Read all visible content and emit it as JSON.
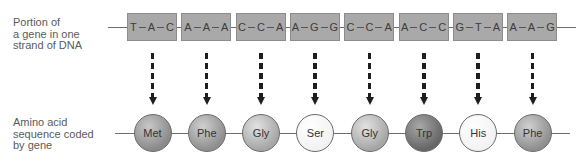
{
  "labels": {
    "dna": [
      "Portion of",
      "a gene in one",
      "strand of DNA"
    ],
    "amino": [
      "Amino acid",
      "sequence coded",
      "by gene"
    ]
  },
  "codons": [
    {
      "bases": [
        "T",
        "A",
        "C"
      ]
    },
    {
      "bases": [
        "A",
        "A",
        "A"
      ]
    },
    {
      "bases": [
        "C",
        "C",
        "A"
      ]
    },
    {
      "bases": [
        "A",
        "G",
        "G"
      ]
    },
    {
      "bases": [
        "C",
        "C",
        "A"
      ]
    },
    {
      "bases": [
        "A",
        "C",
        "C"
      ]
    },
    {
      "bases": [
        "G",
        "T",
        "A"
      ]
    },
    {
      "bases": [
        "A",
        "A",
        "G"
      ]
    }
  ],
  "amino_acids": [
    {
      "name": "Met",
      "shade": "dark-mid",
      "color": "#8a8a8a",
      "highlight": "#c8c8c8"
    },
    {
      "name": "Phe",
      "shade": "mid",
      "color": "#8f8f8f",
      "highlight": "#d0d0d0"
    },
    {
      "name": "Gly",
      "shade": "light-mid",
      "color": "#a6a6a6",
      "highlight": "#e2e2e2"
    },
    {
      "name": "Ser",
      "shade": "white",
      "color": "#f2f2f2",
      "highlight": "#ffffff"
    },
    {
      "name": "Gly",
      "shade": "light-mid",
      "color": "#a6a6a6",
      "highlight": "#e2e2e2"
    },
    {
      "name": "Trp",
      "shade": "dark",
      "color": "#666666",
      "highlight": "#a8a8a8"
    },
    {
      "name": "His",
      "shade": "white",
      "color": "#f2f2f2",
      "highlight": "#ffffff"
    },
    {
      "name": "Phe",
      "shade": "mid",
      "color": "#8f8f8f",
      "highlight": "#d0d0d0"
    }
  ],
  "colors": {
    "codon_box": "#a9a9a9",
    "arrow": "#1e1e1e",
    "line": "#6e6e6e"
  }
}
